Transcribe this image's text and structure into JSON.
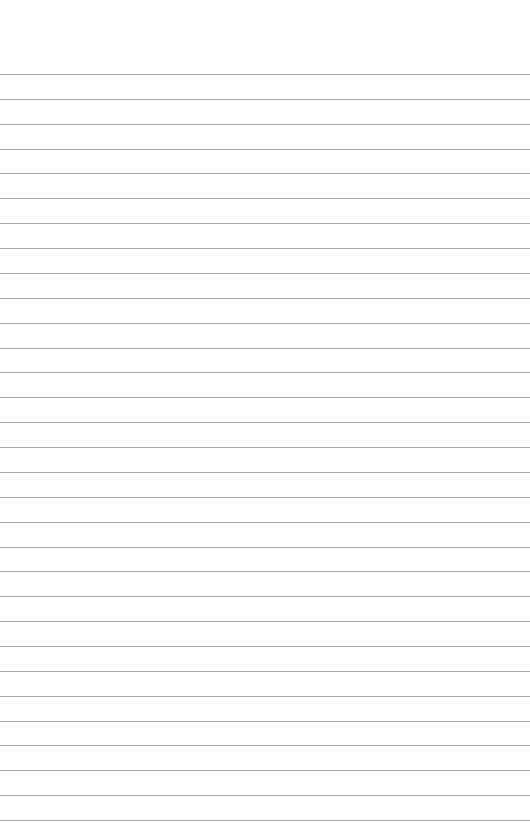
{
  "paper": {
    "background": "#fefefe",
    "line_color": "#9a9a9a",
    "first_line_y": 74,
    "line_spacing": 24.87,
    "line_count": 31
  }
}
